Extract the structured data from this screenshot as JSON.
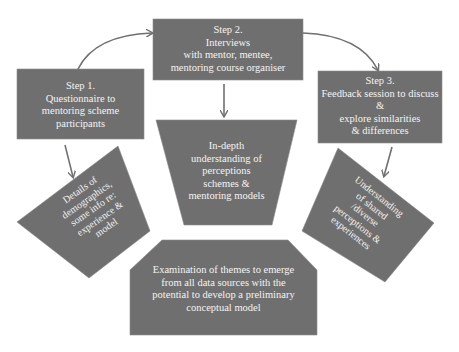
{
  "diagram": {
    "nodes": {
      "step1": {
        "lines": [
          "Step 1.",
          "Questionnaire to",
          "mentoring scheme",
          "participants"
        ]
      },
      "step2": {
        "lines": [
          "Step 2.",
          "Interviews",
          "with mentor, mentee,",
          "mentoring course organiser"
        ]
      },
      "step3": {
        "lines": [
          "Step 3.",
          "Feedback session to discuss",
          "&",
          "explore similarities",
          "& differences"
        ]
      },
      "outcome1": {
        "lines": [
          "Details of",
          "demographics,",
          "some info re:",
          "experience &",
          "model"
        ]
      },
      "outcome2": {
        "lines": [
          "In-depth",
          "understanding of",
          "perceptions",
          "schemes &",
          "mentoring models"
        ]
      },
      "outcome3": {
        "lines": [
          "Understanding",
          "of shared",
          "/diverse",
          "perceptions &",
          "experiences"
        ]
      },
      "synthesis": {
        "lines": [
          "Examination of themes to emerge",
          "from all data sources with the",
          "potential to develop a preliminary",
          "conceptual model"
        ]
      }
    },
    "edges": [
      {
        "from": "step1",
        "to": "step2",
        "type": "curved-arrow"
      },
      {
        "from": "step2",
        "to": "step3",
        "type": "curved-arrow"
      },
      {
        "from": "step1",
        "to": "outcome1",
        "type": "arrow"
      },
      {
        "from": "step2",
        "to": "outcome2",
        "type": "arrow"
      },
      {
        "from": "step3",
        "to": "outcome3",
        "type": "arrow"
      }
    ],
    "colors": {
      "shape_fill": "#6f6f6f",
      "text": "#f4f4f4",
      "arrow": "#707070",
      "background": "#ffffff"
    }
  }
}
